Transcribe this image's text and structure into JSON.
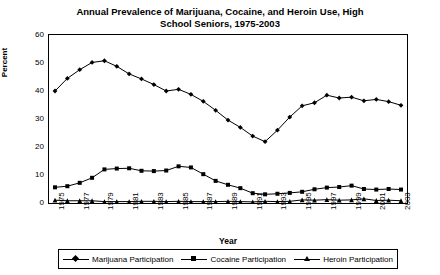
{
  "chart_data": {
    "type": "line",
    "title": "Annual Prevalence of Marijuana, Cocaine, and Heroin Use, High School Seniors, 1975-2003",
    "title_line1": "Annual Prevalence of Marijuana, Cocaine, and Heroin Use, High",
    "title_line2": "School Seniors, 1975-2003",
    "xlabel": "Year",
    "ylabel": "Percent",
    "ylim": [
      0,
      60
    ],
    "yticks": [
      0,
      10,
      20,
      30,
      40,
      50,
      60
    ],
    "ytick_labels": [
      "0",
      "10",
      "20",
      "30",
      "40",
      "50",
      "60"
    ],
    "grid": false,
    "legend_position": "bottom",
    "x": [
      1975,
      1976,
      1977,
      1978,
      1979,
      1980,
      1981,
      1982,
      1983,
      1984,
      1985,
      1986,
      1987,
      1988,
      1989,
      1990,
      1991,
      1992,
      1993,
      1994,
      1995,
      1996,
      1997,
      1998,
      1999,
      2000,
      2001,
      2002,
      2003
    ],
    "categories": [
      "1975",
      "1976",
      "1977",
      "1978",
      "1979",
      "1980",
      "1981",
      "1982",
      "1983",
      "1984",
      "1985",
      "1986",
      "1987",
      "1988",
      "1989",
      "1990",
      "1991",
      "1992",
      "1993",
      "1994",
      "1995",
      "1996",
      "1997",
      "1998",
      "1999",
      "2000",
      "2001",
      "2002",
      "2003"
    ],
    "xtick_labels": [
      "1975",
      "1977",
      "1979",
      "1981",
      "1983",
      "1985",
      "1987",
      "1989",
      "1991",
      "1993",
      "1995",
      "1997",
      "1999",
      "2001",
      "2003"
    ],
    "series": [
      {
        "name": "Marijuana Participation",
        "marker": "diamond",
        "color": "#000000",
        "values": [
          40.0,
          44.5,
          47.6,
          50.2,
          50.8,
          48.8,
          46.1,
          44.3,
          42.3,
          40.0,
          40.6,
          38.8,
          36.3,
          33.1,
          29.6,
          27.0,
          23.9,
          21.9,
          26.0,
          30.7,
          34.7,
          35.8,
          38.5,
          37.5,
          37.8,
          36.5,
          37.0,
          36.2,
          34.9
        ]
      },
      {
        "name": "Cocaine Participation",
        "marker": "square",
        "color": "#000000",
        "values": [
          5.6,
          6.0,
          7.2,
          9.0,
          12.0,
          12.3,
          12.4,
          11.5,
          11.4,
          11.6,
          13.1,
          12.7,
          10.3,
          7.9,
          6.5,
          5.3,
          3.5,
          3.1,
          3.3,
          3.6,
          4.0,
          4.9,
          5.5,
          5.7,
          6.2,
          5.0,
          4.8,
          5.0,
          4.8
        ]
      },
      {
        "name": "Heroin Participation",
        "marker": "triangle",
        "color": "#000000",
        "values": [
          1.0,
          0.8,
          0.8,
          0.8,
          0.5,
          0.5,
          0.5,
          0.6,
          0.6,
          0.5,
          0.6,
          0.5,
          0.5,
          0.5,
          0.6,
          0.5,
          0.4,
          0.6,
          0.5,
          0.6,
          1.1,
          1.0,
          1.2,
          1.0,
          1.1,
          1.5,
          0.9,
          1.0,
          0.8
        ]
      }
    ]
  }
}
